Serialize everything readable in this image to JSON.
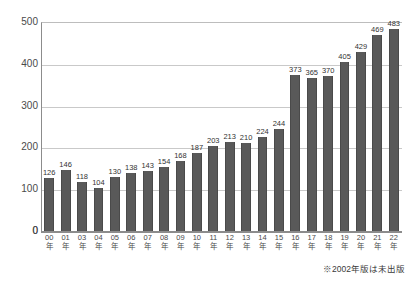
{
  "chart_data": {
    "type": "bar",
    "title": "",
    "xlabel": "",
    "ylabel": "",
    "ylim": [
      0,
      500
    ],
    "yticks": [
      0,
      100,
      200,
      300,
      400,
      500
    ],
    "grid": true,
    "legend": null,
    "bar_color": "#595959",
    "categories": [
      "00年",
      "01年",
      "03年",
      "04年",
      "05年",
      "06年",
      "07年",
      "08年",
      "09年",
      "10年",
      "11年",
      "12年",
      "13年",
      "14年",
      "15年",
      "16年",
      "17年",
      "18年",
      "19年",
      "20年",
      "21年",
      "22年"
    ],
    "tick_numbers": [
      "00",
      "01",
      "03",
      "04",
      "05",
      "06",
      "07",
      "08",
      "09",
      "10",
      "11",
      "12",
      "13",
      "14",
      "15",
      "16",
      "17",
      "18",
      "19",
      "20",
      "21",
      "22"
    ],
    "tick_suffix": "年",
    "values": [
      126,
      146,
      118,
      104,
      130,
      138,
      143,
      154,
      168,
      187,
      203,
      213,
      210,
      224,
      244,
      373,
      365,
      370,
      405,
      429,
      469,
      483
    ],
    "annotations": [
      "※2002年版は未出版"
    ]
  },
  "footnote": "※2002年版は未出版"
}
